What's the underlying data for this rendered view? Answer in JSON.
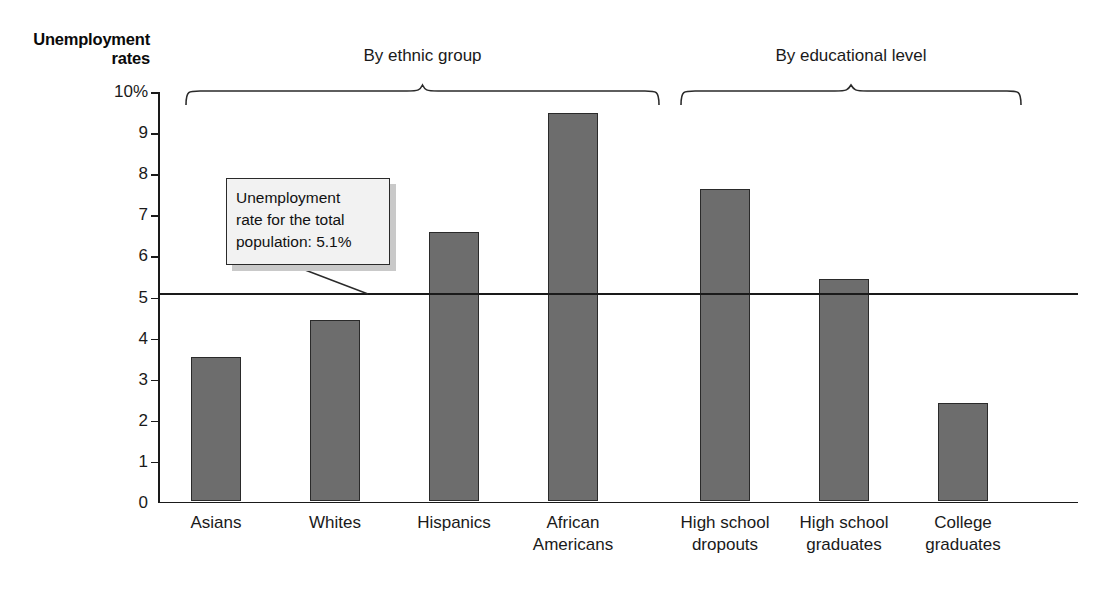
{
  "chart_data": {
    "type": "bar",
    "title": "",
    "ylabel": "Unemployment rates",
    "xlabel": "",
    "ylim": [
      0,
      10
    ],
    "grid": false,
    "legend": "none",
    "y_tick_labels": [
      "10%",
      "9",
      "8",
      "7",
      "6",
      "5",
      "4",
      "3",
      "2",
      "1",
      "0"
    ],
    "y_tick_values": [
      10,
      9,
      8,
      7,
      6,
      5,
      4,
      3,
      2,
      1,
      0
    ],
    "categories": [
      "Asians",
      "Whites",
      "Hispanics",
      "African Americans",
      "High school dropouts",
      "High school graduates",
      "College graduates"
    ],
    "values": [
      3.5,
      4.4,
      6.55,
      9.45,
      7.6,
      5.4,
      2.4
    ],
    "reference_line": {
      "value": 5.1,
      "label": "Unemployment rate for the total population: 5.1%"
    },
    "groups": [
      {
        "label": "By ethnic group",
        "categories": [
          "Asians",
          "Whites",
          "Hispanics",
          "African Americans"
        ]
      },
      {
        "label": "By educational level",
        "categories": [
          "High school dropouts",
          "High school graduates",
          "College graduates"
        ]
      }
    ],
    "colors": {
      "bar_fill": "#6d6d6d",
      "bar_edge": "#2a2a2a",
      "axis": "#1a1a1a",
      "callout_fill": "#f2f2f2",
      "callout_shadow": "#c9c9c9",
      "background": "#ffffff"
    }
  },
  "axis": {
    "y_title_line1": "Unemployment",
    "y_title_line2": "rates"
  },
  "ticks": {
    "t0": "10%",
    "t1": "9",
    "t2": "8",
    "t3": "7",
    "t4": "6",
    "t5": "5",
    "t6": "4",
    "t7": "3",
    "t8": "2",
    "t9": "1",
    "t10": "0"
  },
  "callout": {
    "line1": "Unemployment",
    "line2": "rate for the total",
    "line3": "population: 5.1%"
  },
  "groups": {
    "ethnic_label": "By ethnic group",
    "education_label": "By educational level"
  },
  "categories": {
    "c0_line1": "Asians",
    "c0_line2": "",
    "c1_line1": "Whites",
    "c1_line2": "",
    "c2_line1": "Hispanics",
    "c2_line2": "",
    "c3_line1": "African",
    "c3_line2": "Americans",
    "c4_line1": "High school",
    "c4_line2": "dropouts",
    "c5_line1": "High school",
    "c5_line2": "graduates",
    "c6_line1": "College",
    "c6_line2": "graduates"
  }
}
